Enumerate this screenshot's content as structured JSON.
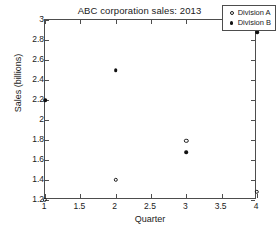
{
  "chart_data": {
    "type": "scatter",
    "title": "ABC corporation sales: 2013",
    "xlabel": "Quarter",
    "ylabel": "Sales (billions)",
    "xlim": [
      1,
      4
    ],
    "ylim": [
      1.2,
      3
    ],
    "grid": false,
    "legend_position": "top-right",
    "xticks": [
      1,
      1.5,
      2,
      2.5,
      3,
      3.5,
      4
    ],
    "xticklabels": [
      "1",
      "1.5",
      "2",
      "2.5",
      "3",
      "3.5",
      "4"
    ],
    "yticks": [
      1.2,
      1.4,
      1.6,
      1.8,
      2,
      2.2,
      2.4,
      2.6,
      2.8,
      3
    ],
    "yticklabels": [
      "1.2",
      "1.4",
      "1.6",
      "1.8",
      "2",
      "2.2",
      "2.4",
      "2.6",
      "2.8",
      "3"
    ],
    "x": [
      1,
      2,
      3,
      4
    ],
    "series": [
      {
        "name": "Division A",
        "marker": "open-circle",
        "color": "#1a1a1a",
        "values": [
          1.2,
          1.4,
          1.79,
          1.28
        ]
      },
      {
        "name": "Division B",
        "marker": "filled-dot",
        "color": "#111111",
        "values": [
          2.2,
          2.5,
          1.68,
          2.88
        ]
      }
    ]
  },
  "legend": {
    "entries": [
      {
        "label": "Division A",
        "marker": "open-circle"
      },
      {
        "label": "Division B",
        "marker": "filled-dot"
      }
    ]
  }
}
